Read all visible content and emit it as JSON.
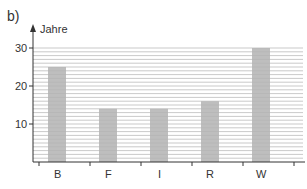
{
  "panel_label": "b)",
  "chart_data": {
    "type": "bar",
    "title": "",
    "xlabel": "",
    "ylabel": "Jahre",
    "categories": [
      "B",
      "F",
      "I",
      "R",
      "W"
    ],
    "values": [
      25,
      14,
      14,
      16,
      30
    ],
    "ylim": [
      0,
      32
    ],
    "yticks": [
      10,
      20,
      30
    ],
    "grid": true,
    "bar_color": "#b3b3b3"
  }
}
